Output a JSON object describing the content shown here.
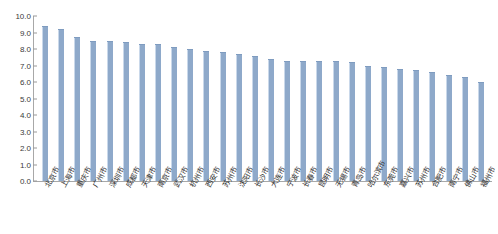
{
  "chart_data": {
    "type": "bar",
    "title": "",
    "subtitle": "",
    "xlabel": "",
    "ylabel": "",
    "ylim": [
      0.0,
      10.0
    ],
    "ytick_step": 1.0,
    "grid": false,
    "legend": null,
    "legend_position": "none",
    "bar_color": "#8ea9ca",
    "axis_color": "#a8a8a8",
    "ytick_labels": [
      "10.0",
      "9.0",
      "8.0",
      "7.0",
      "6.0",
      "5.0",
      "4.0",
      "3.0",
      "2.0",
      "1.0",
      "0.0"
    ],
    "ytick_values": [
      10.0,
      9.0,
      8.0,
      7.0,
      6.0,
      5.0,
      4.0,
      3.0,
      2.0,
      1.0,
      0.0
    ],
    "categories": [
      "北京市",
      "上海市",
      "重庆市",
      "广州市",
      "深圳市",
      "成都市",
      "天津市",
      "南京市",
      "武汉市",
      "杭州市",
      "西安市",
      "苏州市",
      "沈阳市",
      "长沙市",
      "大连市",
      "宁波市",
      "长春市",
      "昆明市",
      "无锡市",
      "青岛市",
      "哈尔滨市",
      "东莞市",
      "嘉兴市",
      "苏州市",
      "合肥市",
      "南宁市",
      "佛山市",
      "福州市"
    ],
    "values": [
      9.4,
      9.2,
      8.7,
      8.5,
      8.5,
      8.4,
      8.3,
      8.3,
      8.1,
      8.0,
      7.9,
      7.8,
      7.7,
      7.6,
      7.4,
      7.3,
      7.3,
      7.3,
      7.3,
      7.2,
      7.0,
      6.9,
      6.8,
      6.7,
      6.6,
      6.4,
      6.3,
      6.0
    ]
  }
}
